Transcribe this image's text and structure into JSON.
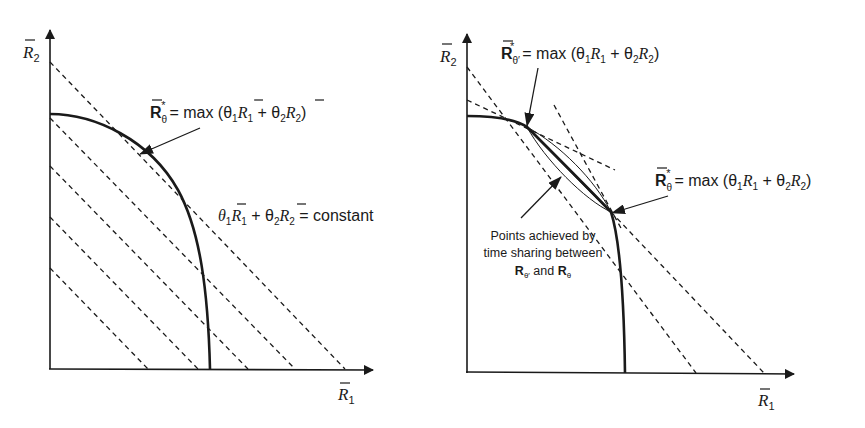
{
  "figure": {
    "left_panel": {
      "x_axis_label": "R̄1",
      "y_axis_label": "R̄2",
      "x_axis_label_base": "R",
      "x_axis_label_sub": "1",
      "y_axis_label_base": "R",
      "y_axis_label_sub": "2",
      "annotation_max": {
        "lhs_base": "R",
        "lhs_sub": "θ",
        "lhs_sup": "*",
        "rhs": "= max (θ",
        "rhs_sub1": "1",
        "rhs_r1": "R",
        "rhs_r1_sub": "1",
        "rhs_plus": " + θ",
        "rhs_sub2": "2",
        "rhs_r2": "R",
        "rhs_r2_sub": "2",
        "rhs_close": ")",
        "full_text": "R̄*θ = max (θ1R̄1 + θ2R̄2)"
      },
      "annotation_constant": {
        "theta1": "θ",
        "theta1_sub": "1",
        "r1": "R",
        "r1_sub": "1",
        "plus": " + θ",
        "theta2_sub": "2",
        "r2": "R",
        "r2_sub": "2",
        "eq": " = constant",
        "full_text": "θ1R̄1 + θ2R̄2 = constant"
      },
      "dashed_line_count": 5
    },
    "right_panel": {
      "x_axis_label_base": "R",
      "x_axis_label_sub": "1",
      "y_axis_label_base": "R",
      "y_axis_label_sub": "2",
      "annotation_max_prime": {
        "lhs_base": "R",
        "lhs_sub": "θ′",
        "lhs_sup": "*",
        "rhs": "= max (θ",
        "rhs_sub1": "1",
        "rhs_r1": "R",
        "rhs_r1_sub": "1",
        "rhs_plus": " + θ",
        "rhs_sub2": "2",
        "rhs_r2": "R",
        "rhs_r2_sub": "2",
        "rhs_close": ")",
        "full_text": "R̄*θ′ = max (θ′1R̄1 + θ′2R̄2)"
      },
      "annotation_max": {
        "lhs_base": "R",
        "lhs_sub": "θ",
        "lhs_sup": "*",
        "rhs": "= max (θ",
        "rhs_sub1": "1",
        "rhs_r1": "R",
        "rhs_r1_sub": "1",
        "rhs_plus": " + θ",
        "rhs_sub2": "2",
        "rhs_r2": "R",
        "rhs_r2_sub": "2",
        "rhs_close": ")",
        "full_text": "R̄*θ = max (θ1R̄1 + θ2R̄2)"
      },
      "time_sharing_note": {
        "line1": "Points achieved by",
        "line2": "time sharing between",
        "line3_a": "R",
        "line3_a_sub": "θ′",
        "line3_and": " and ",
        "line3_b": "R",
        "line3_b_sub": "θ",
        "full_text": "Points achieved by time sharing between R̄*θ′ and R̄*θ"
      }
    },
    "colors": {
      "ink": "#1a1a1a",
      "background": "#ffffff"
    }
  }
}
